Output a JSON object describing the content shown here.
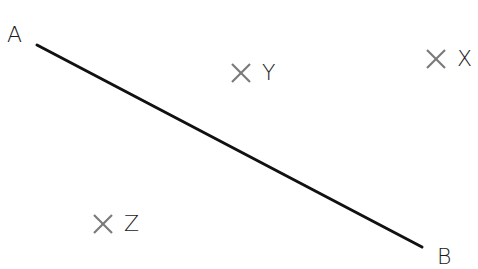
{
  "diagram": {
    "segment": {
      "start_label": "A",
      "end_label": "B",
      "start": [
        37,
        45
      ],
      "end": [
        422,
        247
      ],
      "color": "#111111"
    },
    "points": [
      {
        "label": "Y",
        "marker": "cross",
        "center": [
          241,
          73
        ]
      },
      {
        "label": "X",
        "marker": "cross",
        "center": [
          436,
          59
        ]
      },
      {
        "label": "Z",
        "marker": "cross",
        "center": [
          103,
          224
        ]
      }
    ],
    "marker_color": "#7a7a7a"
  }
}
